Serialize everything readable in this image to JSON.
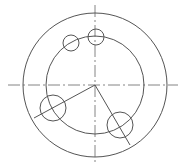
{
  "drawing": {
    "width": 183,
    "height": 168,
    "background": "#ffffff",
    "stroke_color": "#555555",
    "center_line_color": "#666666",
    "center": {
      "x": 95,
      "y": 85
    },
    "center_lines": {
      "horizontal": {
        "x1": 8,
        "y1": 85,
        "x2": 178,
        "y2": 85
      },
      "vertical": {
        "x1": 95,
        "y1": 5,
        "x2": 95,
        "y2": 163
      },
      "dash": "12 3 2 3"
    },
    "outer_circle": {
      "cx": 95,
      "cy": 85,
      "r": 72
    },
    "inner_circle": {
      "cx": 95,
      "cy": 85,
      "r": 49
    },
    "holes": [
      {
        "name": "top-hole",
        "cx": 96,
        "cy": 37,
        "r": 8
      },
      {
        "name": "upper-left-hole",
        "cx": 71,
        "cy": 43,
        "r": 8
      },
      {
        "name": "left-hole",
        "cx": 53,
        "cy": 108,
        "r": 13
      },
      {
        "name": "lower-right-hole",
        "cx": 120,
        "cy": 125,
        "r": 13
      }
    ],
    "radial_lines": [
      {
        "name": "radial-line-left",
        "x1": 95,
        "y1": 85,
        "x2": 34,
        "y2": 118
      },
      {
        "name": "radial-line-right",
        "x1": 95,
        "y1": 85,
        "x2": 130,
        "y2": 145
      }
    ]
  }
}
